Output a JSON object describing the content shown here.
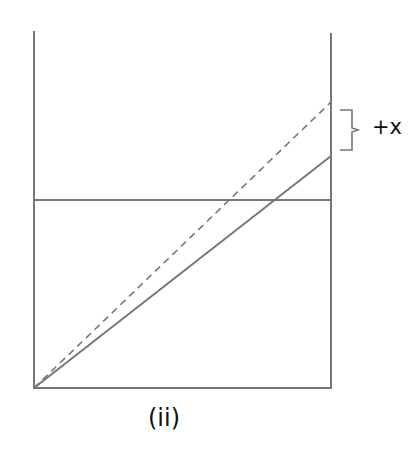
{
  "diagram": {
    "caption": "(ii)",
    "brace_label": "+x",
    "line_color": "#777777",
    "elements": [
      {
        "name": "left-vertical-axis",
        "type": "solid",
        "x1": 34,
        "y1": 31,
        "x2": 34,
        "y2": 388
      },
      {
        "name": "right-vertical-axis",
        "type": "solid",
        "x1": 331,
        "y1": 33,
        "x2": 331,
        "y2": 388
      },
      {
        "name": "baseline",
        "type": "solid",
        "x1": 34,
        "y1": 388,
        "x2": 331,
        "y2": 388
      },
      {
        "name": "horizontal-level-line",
        "type": "solid",
        "x1": 34,
        "y1": 200,
        "x2": 331,
        "y2": 200
      },
      {
        "name": "dashed-diagonal",
        "type": "dashed",
        "x1": 34,
        "y1": 388,
        "x2": 331,
        "y2": 102
      },
      {
        "name": "solid-diagonal",
        "type": "solid",
        "x1": 34,
        "y1": 388,
        "x2": 331,
        "y2": 156
      }
    ]
  }
}
